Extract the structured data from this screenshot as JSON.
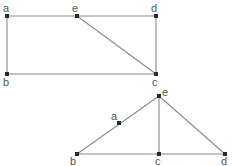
{
  "diagrams": [
    {
      "id": "top",
      "shape": "rectangle-with-diagonal",
      "nodes": [
        {
          "label": "a",
          "x": 7,
          "y": 16,
          "lx": 3,
          "ly": 12
        },
        {
          "label": "e",
          "x": 77,
          "y": 16,
          "lx": 72,
          "ly": 12
        },
        {
          "label": "d",
          "x": 156,
          "y": 16,
          "lx": 151,
          "ly": 12
        },
        {
          "label": "b",
          "x": 7,
          "y": 74,
          "lx": 3,
          "ly": 86
        },
        {
          "label": "c",
          "x": 156,
          "y": 74,
          "lx": 152,
          "ly": 86
        }
      ],
      "edges": [
        [
          "a",
          "e"
        ],
        [
          "e",
          "d"
        ],
        [
          "a",
          "b"
        ],
        [
          "d",
          "c"
        ],
        [
          "b",
          "c"
        ],
        [
          "e",
          "c"
        ]
      ]
    },
    {
      "id": "bottom",
      "shape": "triangle-with-altitude",
      "nodes": [
        {
          "label": "e",
          "x": 159,
          "y": 96,
          "lx": 162,
          "ly": 96
        },
        {
          "label": "a",
          "x": 119,
          "y": 123,
          "lx": 111,
          "ly": 120
        },
        {
          "label": "b",
          "x": 77,
          "y": 154,
          "lx": 70,
          "ly": 165
        },
        {
          "label": "c",
          "x": 159,
          "y": 154,
          "lx": 155,
          "ly": 165
        },
        {
          "label": "d",
          "x": 225,
          "y": 154,
          "lx": 221,
          "ly": 165
        }
      ],
      "edges": [
        [
          "b",
          "e"
        ],
        [
          "e",
          "d"
        ],
        [
          "e",
          "c"
        ],
        [
          "b",
          "c"
        ],
        [
          "c",
          "d"
        ]
      ]
    }
  ],
  "colors": {
    "edge": "#8a8a8a",
    "node": "#2a2a2a",
    "label": "#555555"
  }
}
